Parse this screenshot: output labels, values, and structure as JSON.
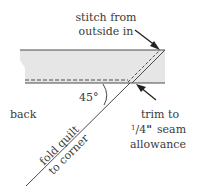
{
  "labels": {
    "stitch_line1": "stitch from",
    "stitch_line2": "outside in",
    "angle": "45°",
    "back": "back",
    "fold_line1": "fold quilt",
    "fold_line2": "to corner",
    "trim_line1": "trim to",
    "trim_frac_num": "1",
    "trim_frac_den": "4",
    "trim_inch": "\"",
    "trim_seam": "seam",
    "trim_line3": "allowance"
  },
  "colors": {
    "band_fill": "#e6e6e6",
    "line": "#4a4a4a",
    "text": "#3a3a3a",
    "background": "#ffffff"
  }
}
